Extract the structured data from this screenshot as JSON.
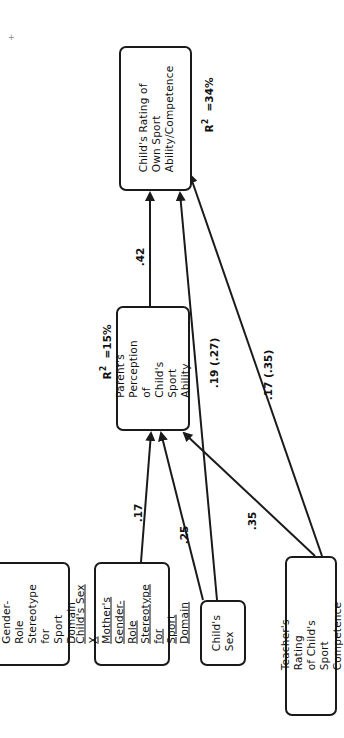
{
  "diagram": {
    "type": "path-diagram",
    "orientation": "rotated-90-ccw",
    "nodes": [
      {
        "id": "child_rating",
        "label": "Child's Rating of\nOwn Sport\nAbility/Competence",
        "underlined": false
      },
      {
        "id": "parent_perception",
        "label": "Parent's\nPerception of\nChild's Sport\nAbility",
        "underlined": false
      },
      {
        "id": "mother_stereotype",
        "label": "Mother's\nGender-Role\nStereotype for\nSport Domain",
        "underlined": false
      },
      {
        "id": "sex_x_stereotype",
        "label": "Child's Sex X\nMother's\nGender-Role\nStereotype for\nSport Domain",
        "underlined": true
      },
      {
        "id": "child_sex",
        "label": "Child's Sex",
        "underlined": false
      },
      {
        "id": "teacher_rating",
        "label": "Teacher's Rating\nof Child's Sport\nCompetence",
        "underlined": false
      }
    ],
    "r_squared": {
      "child_rating": {
        "prefix": "R",
        "sup": "2",
        "value": "=34%"
      },
      "parent_perception": {
        "prefix": "R",
        "sup": "2",
        "value": "=15%"
      }
    },
    "edges": [
      {
        "from": "parent_perception",
        "to": "child_rating",
        "label": ".42"
      },
      {
        "from": "sex_x_stereotype",
        "to": "parent_perception",
        "label": ".17"
      },
      {
        "from": "child_sex",
        "to": "parent_perception",
        "label": ".25"
      },
      {
        "from": "teacher_rating",
        "to": "parent_perception",
        "label": ".35"
      },
      {
        "from": "child_sex",
        "to": "child_rating",
        "label": ".19 (.27)"
      },
      {
        "from": "teacher_rating",
        "to": "child_rating",
        "label": ".17 (.35)"
      }
    ]
  },
  "colors": {
    "line": "#1a1a1a",
    "background": "#ffffff"
  }
}
